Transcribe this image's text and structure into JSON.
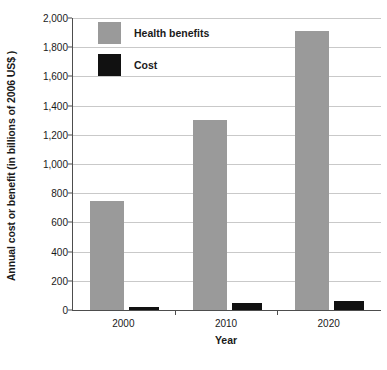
{
  "chart_data": {
    "type": "bar",
    "title": "",
    "subtitle": "",
    "xlabel": "Year",
    "ylabel": "Annual cost or benefit (in billions of 2006 US$ )",
    "categories": [
      "2000",
      "2010",
      "2020"
    ],
    "series": [
      {
        "name": "Health benefits",
        "color": "#9a9a9a",
        "values": [
          750,
          1300,
          1910
        ]
      },
      {
        "name": "Cost",
        "color": "#111111",
        "values": [
          20,
          45,
          65
        ]
      }
    ],
    "ylim": [
      0,
      2000
    ],
    "ytick_values": [
      0,
      200,
      400,
      600,
      800,
      1000,
      1200,
      1400,
      1600,
      1800,
      2000
    ],
    "ytick_labels": [
      "0",
      "200",
      "400",
      "600",
      "800",
      "1,000",
      "1,200",
      "1,400",
      "1,600",
      "1,800",
      "2,000"
    ],
    "grid": true,
    "grid_axis": "y",
    "legend_position": "top-left-inside",
    "legend": [
      "Health benefits",
      "Cost"
    ],
    "annotations": []
  },
  "colors": {
    "benefit": "#9a9a9a",
    "cost": "#111111",
    "gridline": "#c9c9c9",
    "axis": "#4d4d4d",
    "text": "#1a1a1a",
    "background": "#ffffff"
  }
}
